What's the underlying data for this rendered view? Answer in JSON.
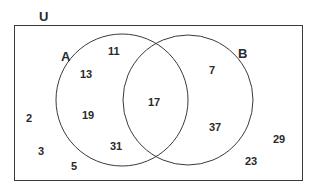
{
  "diagram": {
    "type": "venn",
    "universe": {
      "label": "U"
    },
    "sets": [
      {
        "label": "A"
      },
      {
        "label": "B"
      }
    ],
    "regions": {
      "a_only": [
        "11",
        "13",
        "19",
        "31"
      ],
      "intersection": [
        "17"
      ],
      "b_only": [
        "7",
        "37"
      ],
      "outside": [
        "2",
        "3",
        "5",
        "29",
        "23"
      ]
    },
    "colors": {
      "stroke": "#3a3a3a",
      "text": "#2a2a2a",
      "background": "#ffffff"
    }
  }
}
